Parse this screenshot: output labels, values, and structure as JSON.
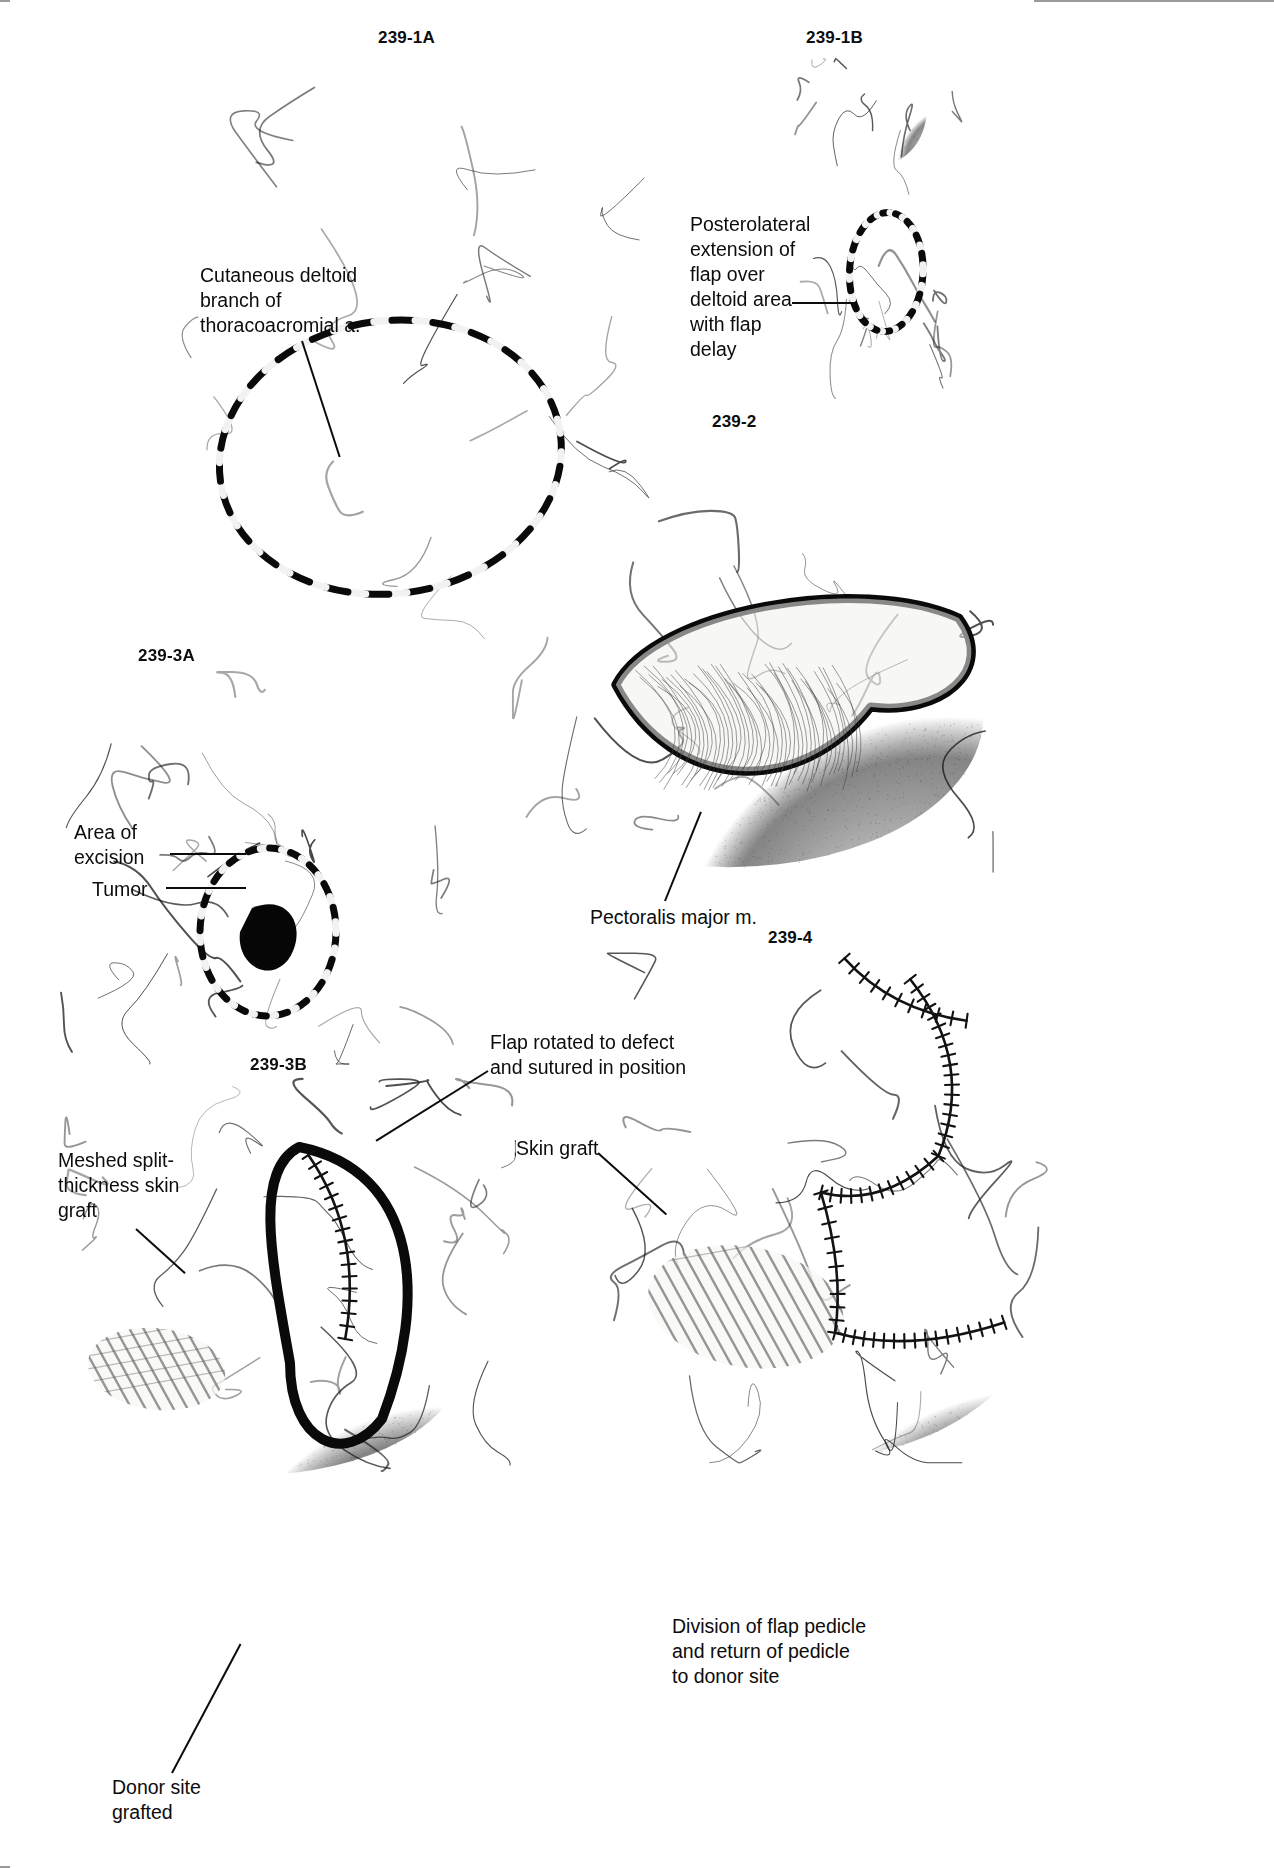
{
  "page": {
    "background": "#ffffff",
    "ink": "#111111",
    "width": 1274,
    "height": 1868
  },
  "panels": [
    {
      "id": "239-1A",
      "label": "239-1A",
      "description": "Anterior view of head, neck and chest with outlined pectoralis major myocutaneous flap skin paddle marked by dashed incision line",
      "num_x": 378,
      "num_y": 28,
      "fig_x": 172,
      "fig_y": 48,
      "fig_w": 520,
      "fig_h": 620,
      "seed": 11
    },
    {
      "id": "239-1B",
      "label": "239-1B",
      "description": "Lateral view of head and shoulder showing posterolateral deltoid extension of the flap outlined with dashed line",
      "num_x": 806,
      "num_y": 28,
      "fig_x": 790,
      "fig_y": 55,
      "fig_w": 175,
      "fig_h": 350,
      "seed": 23
    },
    {
      "id": "239-2",
      "label": "239-2",
      "description": "Chest and neck with pectoralis major muscle elevated, flap raised showing undersurface of muscle and skin paddle",
      "num_x": 712,
      "num_y": 412,
      "fig_x": 508,
      "fig_y": 440,
      "fig_w": 490,
      "fig_h": 445,
      "seed": 37
    },
    {
      "id": "239-3A",
      "label": "239-3A",
      "description": "Lateral view of face and neck showing area of excision outlined and the tumor shaded black",
      "num_x": 138,
      "num_y": 646,
      "fig_x": 60,
      "fig_y": 668,
      "fig_w": 400,
      "fig_h": 400,
      "seed": 53
    },
    {
      "id": "239-3B",
      "label": "239-3B",
      "description": "Neck and chest after flap rotation into the defect, sutured in position, donor site covered with meshed split-thickness skin graft",
      "num_x": 250,
      "num_y": 1055,
      "fig_x": 60,
      "fig_y": 1075,
      "fig_w": 460,
      "fig_h": 400,
      "seed": 71
    },
    {
      "id": "239-4",
      "label": "239-4",
      "description": "Final result after division of the flap pedicle and return of pedicle to the donor site with meshed skin graft",
      "num_x": 768,
      "num_y": 928,
      "fig_x": 600,
      "fig_y": 948,
      "fig_w": 470,
      "fig_h": 520,
      "seed": 97
    }
  ],
  "labels": [
    {
      "name": "cutaneous-deltoid-branch",
      "text": "Cutaneous deltoid\nbranch of\nthoracoacromial a.",
      "x": 200,
      "y": 263,
      "w": 240,
      "align": "left",
      "leader": {
        "x": 302,
        "y": 340,
        "len": 122,
        "angle": 72
      }
    },
    {
      "name": "posterolateral-extension",
      "text": "Posterolateral\nextension of\nflap over\ndeltoid area\nwith flap\ndelay",
      "x": 690,
      "y": 212,
      "w": 150,
      "align": "left",
      "leader": {
        "x": 792,
        "y": 302,
        "len": 64,
        "angle": 0
      }
    },
    {
      "name": "pectoralis-major-muscle",
      "text": "Pectoralis major m.",
      "x": 590,
      "y": 905,
      "w": 230,
      "align": "left",
      "leader": {
        "x": 665,
        "y": 900,
        "len": 96,
        "angle": -68
      }
    },
    {
      "name": "area-of-excision",
      "text": "Area of\nexcision",
      "x": 74,
      "y": 820,
      "w": 110,
      "align": "left",
      "leader": {
        "x": 170,
        "y": 853,
        "len": 76,
        "angle": 0
      }
    },
    {
      "name": "tumor",
      "text": "Tumor",
      "x": 92,
      "y": 877,
      "w": 90,
      "align": "left",
      "leader": {
        "x": 166,
        "y": 887,
        "len": 80,
        "angle": 0
      }
    },
    {
      "name": "flap-rotated-to-defect",
      "text": "Flap rotated to defect\nand sutured in position",
      "x": 490,
      "y": 1030,
      "w": 270,
      "align": "left",
      "leader": {
        "x": 488,
        "y": 1070,
        "len": 132,
        "angle": 148
      }
    },
    {
      "name": "skin-graft",
      "text": "Skin graft",
      "x": 516,
      "y": 1136,
      "w": 130,
      "align": "left",
      "leader": {
        "x": 598,
        "y": 1152,
        "len": 92,
        "angle": 42
      }
    },
    {
      "name": "meshed-split-thickness-skin-graft",
      "text": "Meshed split-\nthickness skin\ngraft",
      "x": 58,
      "y": 1148,
      "w": 150,
      "align": "left",
      "leader": {
        "x": 136,
        "y": 1228,
        "len": 66,
        "angle": 42
      }
    },
    {
      "name": "donor-site-grafted",
      "text": "Donor site\ngrafted",
      "x": 112,
      "y": 1775,
      "w": 150,
      "align": "left",
      "leader": {
        "x": 172,
        "y": 1772,
        "len": 146,
        "angle": -62
      }
    },
    {
      "name": "division-of-flap-pedicle",
      "text": "Division of flap pedicle\nand return of pedicle\nto donor site",
      "x": 672,
      "y": 1614,
      "w": 290,
      "align": "left",
      "leader": null
    }
  ],
  "chart_data": {
    "type": "table",
    "columns": [
      "Panel",
      "Depicted step"
    ],
    "rows": [
      [
        "239-1A",
        "Flap design on anterior chest; cutaneous deltoid branch of thoracoacromial a. marked"
      ],
      [
        "239-1B",
        "Posterolateral extension of flap over deltoid area with flap delay"
      ],
      [
        "239-2",
        "Flap elevated revealing pectoralis major m."
      ],
      [
        "239-3A",
        "Area of excision and tumor outlined on face/neck"
      ],
      [
        "239-3B",
        "Flap rotated to defect and sutured in position; donor site grafted with meshed split-thickness skin graft"
      ],
      [
        "239-4",
        "Division of flap pedicle and return of pedicle to donor site; skin graft in place"
      ]
    ]
  }
}
